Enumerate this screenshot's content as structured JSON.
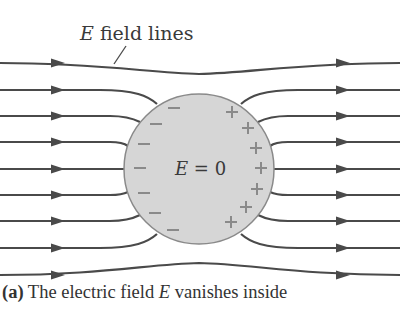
{
  "figure": {
    "label": {
      "prefix": "E",
      "suffix": " field lines"
    },
    "interior_label": {
      "symbol": "E",
      "rest": " = 0"
    },
    "caption": {
      "tag": "(a)",
      "text_before": " The electric field ",
      "symbol": "E",
      "text_after": " vanishes inside"
    },
    "colors": {
      "line": "#4a4a4a",
      "sphere_fill": "#d6d6d6",
      "sphere_stroke": "#8a8a8a",
      "charge": "#8a8a8a",
      "text": "#333333"
    },
    "sphere": {
      "cx": 199,
      "cy": 169,
      "r": 75
    },
    "field_lines": [
      {
        "d": "M0 63 C 100 63, 150 73, 199 74 C 250 73, 300 63, 400 63"
      },
      {
        "d": "M0 90 L 100 90 C 135 90, 148 96, 157 104"
      },
      {
        "d": "M241 104 C 250 96, 263 90, 298 90 L 400 90"
      },
      {
        "d": "M0 116 L 110 116 C 125 116, 132 118, 140 122"
      },
      {
        "d": "M258 122 C 266 118, 273 116, 288 116 L 400 116"
      },
      {
        "d": "M0 142 L 110 142 C 120 142, 124 143, 128 146"
      },
      {
        "d": "M270 146 C 274 143, 278 142, 288 142 L 400 142"
      },
      {
        "d": "M0 169 L 125 169"
      },
      {
        "d": "M273 169 L 400 169"
      },
      {
        "d": "M0 195 L 110 195 C 120 195, 124 194, 128 192"
      },
      {
        "d": "M270 192 C 274 194, 278 195, 288 195 L 400 195"
      },
      {
        "d": "M0 221 L 110 221 C 125 221, 132 219, 140 215"
      },
      {
        "d": "M258 215 C 266 219, 273 221, 288 221 L 400 221"
      },
      {
        "d": "M0 248 L 100 248 C 135 248, 148 242, 157 234"
      },
      {
        "d": "M241 234 C 250 242, 263 248, 298 248 L 400 248"
      },
      {
        "d": "M0 275 C 100 275, 150 264, 199 263 C 250 264, 300 275, 400 275"
      }
    ],
    "arrows_left": [
      63,
      90,
      116,
      142,
      169,
      195,
      221,
      248,
      275
    ],
    "arrows_right": [
      63,
      90,
      116,
      142,
      169,
      195,
      221,
      248,
      275
    ],
    "arrow_x_left": 58,
    "arrow_x_right": 343,
    "pointer": {
      "x1": 114,
      "y1": 64,
      "x2": 126,
      "y2": 46
    },
    "negative_charges": [
      {
        "x": 174,
        "y": 108
      },
      {
        "x": 156,
        "y": 124
      },
      {
        "x": 144,
        "y": 144
      },
      {
        "x": 140,
        "y": 168
      },
      {
        "x": 144,
        "y": 193
      },
      {
        "x": 155,
        "y": 213
      },
      {
        "x": 173,
        "y": 230
      }
    ],
    "positive_charges": [
      {
        "x": 232,
        "y": 112
      },
      {
        "x": 248,
        "y": 128
      },
      {
        "x": 256,
        "y": 148
      },
      {
        "x": 261,
        "y": 168
      },
      {
        "x": 257,
        "y": 189
      },
      {
        "x": 246,
        "y": 207
      },
      {
        "x": 231,
        "y": 222
      }
    ]
  }
}
